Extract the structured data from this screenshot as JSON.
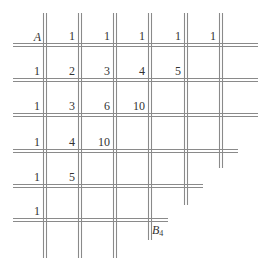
{
  "diagram": {
    "type": "lattice-path-grid",
    "line_color": "#8a8a8a",
    "start_label": "A",
    "end_label": "B",
    "end_subscript": "4",
    "vertical_lines": [
      {
        "x": 45,
        "y1": 13,
        "y2": 258
      },
      {
        "x": 80,
        "y1": 13,
        "y2": 258
      },
      {
        "x": 115,
        "y1": 13,
        "y2": 258
      },
      {
        "x": 150,
        "y1": 13,
        "y2": 240
      },
      {
        "x": 186,
        "y1": 13,
        "y2": 205
      },
      {
        "x": 221,
        "y1": 13,
        "y2": 168
      }
    ],
    "horizontal_lines": [
      {
        "y": 45,
        "x1": 13,
        "x2": 258
      },
      {
        "y": 80,
        "x1": 13,
        "x2": 258
      },
      {
        "y": 115,
        "x1": 13,
        "x2": 258
      },
      {
        "y": 151,
        "x1": 13,
        "x2": 238
      },
      {
        "y": 186,
        "x1": 13,
        "x2": 203
      },
      {
        "y": 220,
        "x1": 13,
        "x2": 168
      }
    ],
    "values": [
      {
        "row": 0,
        "col": 1,
        "text": "1"
      },
      {
        "row": 0,
        "col": 2,
        "text": "1"
      },
      {
        "row": 0,
        "col": 3,
        "text": "1"
      },
      {
        "row": 0,
        "col": 4,
        "text": "1"
      },
      {
        "row": 0,
        "col": 5,
        "text": "1"
      },
      {
        "row": 1,
        "col": 0,
        "text": "1"
      },
      {
        "row": 1,
        "col": 1,
        "text": "2"
      },
      {
        "row": 1,
        "col": 2,
        "text": "3"
      },
      {
        "row": 1,
        "col": 3,
        "text": "4"
      },
      {
        "row": 1,
        "col": 4,
        "text": "5"
      },
      {
        "row": 2,
        "col": 0,
        "text": "1"
      },
      {
        "row": 2,
        "col": 1,
        "text": "3"
      },
      {
        "row": 2,
        "col": 2,
        "text": "6"
      },
      {
        "row": 2,
        "col": 3,
        "text": "10"
      },
      {
        "row": 3,
        "col": 0,
        "text": "1"
      },
      {
        "row": 3,
        "col": 1,
        "text": "4"
      },
      {
        "row": 3,
        "col": 2,
        "text": "10"
      },
      {
        "row": 4,
        "col": 0,
        "text": "1"
      },
      {
        "row": 4,
        "col": 1,
        "text": "5"
      },
      {
        "row": 5,
        "col": 0,
        "text": "1"
      }
    ]
  }
}
